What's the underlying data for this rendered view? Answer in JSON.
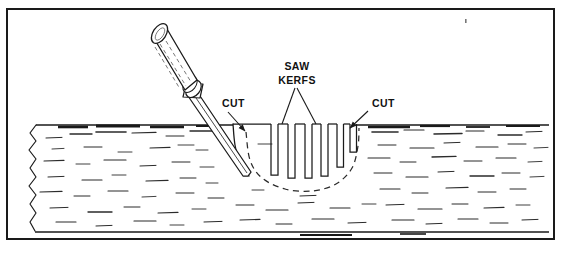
{
  "figure": {
    "domain": "technical-line-illustration",
    "frame": {
      "border_color": "#1a1a1a",
      "border_width_px": 2,
      "x": 6,
      "y": 8,
      "width": 549,
      "height": 232
    },
    "colors": {
      "ink": "#1a1a1a",
      "line": "#222222",
      "grain": "#2b2b2b",
      "paper": "#ffffff",
      "dashed_guide": "#333333"
    }
  },
  "labels": [
    {
      "id": "saw-kerfs",
      "line1": "SAW",
      "line2": "KERFS",
      "x": 297,
      "y": 70
    },
    {
      "id": "cut-left",
      "text": "CUT",
      "x": 222,
      "y": 107
    },
    {
      "id": "cut-right",
      "text": "CUT",
      "x": 372,
      "y": 107
    }
  ],
  "leaders": [
    {
      "id": "saw-kerfs-leader-a",
      "from": [
        295,
        88
      ],
      "to": [
        282,
        124
      ],
      "arrow": false
    },
    {
      "id": "saw-kerfs-leader-b",
      "from": [
        297,
        88
      ],
      "to": [
        316,
        124
      ],
      "arrow": false
    },
    {
      "id": "cut-left-arrow",
      "from": [
        228,
        112
      ],
      "to": [
        245,
        131
      ],
      "arrow": true
    },
    {
      "id": "cut-right-arrow",
      "from": [
        368,
        111
      ],
      "to": [
        350,
        128
      ],
      "arrow": true
    }
  ],
  "workpiece": {
    "name": "wood-stock",
    "top_surface_y": 124,
    "bottom_surface_y": 232,
    "left_break_x": 32,
    "right_edge_x": 549,
    "description": "Side view of a board with torn break line at left edge and wood grain hatching"
  },
  "chisel": {
    "name": "wood-chisel",
    "handle": {
      "butt_center": [
        159,
        41
      ],
      "ferrule_center": [
        208,
        96
      ]
    },
    "blade_tip": [
      248,
      175
    ],
    "description": "Chisel with turned wooden handle, ferrule and long tapered blade driven into the stock"
  },
  "saw_kerfs": {
    "count": 6,
    "description": "Vertical saw kerfs cut from the top surface down to the curved waste line, getting shallower toward the right",
    "kerfs": [
      {
        "index": 1,
        "x_left": 271,
        "width": 7,
        "depth_to_y": 175
      },
      {
        "index": 2,
        "x_left": 288,
        "width": 7,
        "depth_to_y": 178
      },
      {
        "index": 3,
        "x_left": 305,
        "width": 7,
        "depth_to_y": 178
      },
      {
        "index": 4,
        "x_left": 321,
        "width": 7,
        "depth_to_y": 176
      },
      {
        "index": 5,
        "x_left": 337,
        "width": 6.5,
        "depth_to_y": 167
      },
      {
        "index": 6,
        "x_left": 350,
        "width": 6.5,
        "depth_to_y": 152
      }
    ]
  },
  "waste_curve": {
    "name": "dashed-waste-line",
    "style": "dashed",
    "description": "Dashed arc showing the hollow to be removed, running from the chisel cut at left, under the kerfs, and back up to the right CUT mark",
    "points": [
      [
        246,
        132
      ],
      [
        250,
        160
      ],
      [
        262,
        178
      ],
      [
        285,
        189
      ],
      [
        312,
        191
      ],
      [
        336,
        184
      ],
      [
        352,
        168
      ],
      [
        358,
        146
      ],
      [
        359,
        128
      ]
    ]
  },
  "chisel_cut_line": {
    "name": "chisel-entry-cut",
    "description": "Solid curved line at the left side of the hollow where the chisel enters the stock",
    "points": [
      [
        233,
        124
      ],
      [
        235,
        145
      ],
      [
        240,
        163
      ],
      [
        249,
        176
      ]
    ]
  },
  "grain_marks": {
    "description": "Short horizontal dashes representing wood grain on the sawn face",
    "segments": [
      [
        46,
        138,
        16,
        1.0
      ],
      [
        70,
        134,
        22,
        1.4
      ],
      [
        96,
        132,
        30,
        1.6
      ],
      [
        132,
        133,
        24,
        1.2
      ],
      [
        166,
        136,
        18,
        1.0
      ],
      [
        190,
        131,
        26,
        1.4
      ],
      [
        52,
        149,
        12,
        0.9
      ],
      [
        84,
        147,
        18,
        1.0
      ],
      [
        118,
        152,
        14,
        0.9
      ],
      [
        150,
        148,
        20,
        1.1
      ],
      [
        178,
        145,
        16,
        0.9
      ],
      [
        196,
        150,
        12,
        0.9
      ],
      [
        44,
        161,
        20,
        1.1
      ],
      [
        76,
        164,
        14,
        0.9
      ],
      [
        104,
        160,
        22,
        1.2
      ],
      [
        140,
        166,
        16,
        1.0
      ],
      [
        172,
        162,
        18,
        1.0
      ],
      [
        200,
        167,
        14,
        0.9
      ],
      [
        48,
        177,
        16,
        1.0
      ],
      [
        82,
        180,
        20,
        1.1
      ],
      [
        112,
        175,
        14,
        0.9
      ],
      [
        146,
        181,
        22,
        1.2
      ],
      [
        180,
        178,
        16,
        1.0
      ],
      [
        206,
        183,
        12,
        0.9
      ],
      [
        40,
        192,
        22,
        1.2
      ],
      [
        74,
        196,
        16,
        1.0
      ],
      [
        108,
        191,
        20,
        1.1
      ],
      [
        142,
        197,
        14,
        0.9
      ],
      [
        176,
        193,
        18,
        1.0
      ],
      [
        208,
        198,
        16,
        1.0
      ],
      [
        50,
        208,
        18,
        1.0
      ],
      [
        88,
        212,
        24,
        1.3
      ],
      [
        124,
        207,
        16,
        1.0
      ],
      [
        158,
        213,
        20,
        1.1
      ],
      [
        192,
        209,
        14,
        0.9
      ],
      [
        56,
        222,
        20,
        1.1
      ],
      [
        96,
        226,
        16,
        1.0
      ],
      [
        134,
        221,
        22,
        1.2
      ],
      [
        170,
        225,
        14,
        0.9
      ],
      [
        204,
        222,
        18,
        1.0
      ],
      [
        236,
        205,
        18,
        1.0
      ],
      [
        266,
        210,
        22,
        1.2
      ],
      [
        298,
        203,
        16,
        1.0
      ],
      [
        330,
        208,
        20,
        1.1
      ],
      [
        362,
        204,
        14,
        0.9
      ],
      [
        240,
        220,
        20,
        1.1
      ],
      [
        276,
        224,
        16,
        1.0
      ],
      [
        312,
        219,
        22,
        1.2
      ],
      [
        348,
        223,
        18,
        1.0
      ],
      [
        372,
        132,
        26,
        1.6
      ],
      [
        404,
        130,
        20,
        1.2
      ],
      [
        434,
        134,
        28,
        1.5
      ],
      [
        466,
        131,
        18,
        1.1
      ],
      [
        498,
        135,
        24,
        1.3
      ],
      [
        526,
        132,
        16,
        1.0
      ],
      [
        378,
        145,
        18,
        1.0
      ],
      [
        410,
        148,
        24,
        1.2
      ],
      [
        444,
        143,
        16,
        1.0
      ],
      [
        476,
        147,
        22,
        1.2
      ],
      [
        508,
        144,
        18,
        1.0
      ],
      [
        534,
        148,
        14,
        0.9
      ],
      [
        368,
        158,
        22,
        1.1
      ],
      [
        400,
        162,
        16,
        1.0
      ],
      [
        432,
        157,
        24,
        1.3
      ],
      [
        464,
        161,
        18,
        1.0
      ],
      [
        496,
        158,
        20,
        1.1
      ],
      [
        528,
        162,
        14,
        0.9
      ],
      [
        374,
        173,
        18,
        1.0
      ],
      [
        406,
        177,
        22,
        1.2
      ],
      [
        438,
        172,
        16,
        1.0
      ],
      [
        470,
        176,
        24,
        1.3
      ],
      [
        502,
        173,
        18,
        1.0
      ],
      [
        530,
        177,
        14,
        0.9
      ],
      [
        380,
        189,
        20,
        1.1
      ],
      [
        412,
        193,
        16,
        1.0
      ],
      [
        446,
        188,
        22,
        1.2
      ],
      [
        478,
        192,
        18,
        1.0
      ],
      [
        510,
        189,
        16,
        1.0
      ],
      [
        386,
        205,
        18,
        1.0
      ],
      [
        418,
        209,
        24,
        1.2
      ],
      [
        452,
        204,
        16,
        1.0
      ],
      [
        484,
        208,
        20,
        1.1
      ],
      [
        516,
        205,
        14,
        0.9
      ],
      [
        392,
        220,
        22,
        1.2
      ],
      [
        426,
        224,
        16,
        1.0
      ],
      [
        458,
        219,
        20,
        1.1
      ],
      [
        490,
        223,
        18,
        1.0
      ],
      [
        522,
        220,
        16,
        1.0
      ],
      [
        258,
        144,
        14,
        0.9
      ],
      [
        252,
        190,
        12,
        0.9
      ],
      [
        300,
        196,
        16,
        1.0
      ]
    ]
  },
  "surface_shadow_marks": {
    "description": "Heavier dark dashes along the top sawn edge suggesting the cut surface",
    "segments": [
      [
        58,
        127,
        30,
        2.6
      ],
      [
        96,
        126,
        44,
        3.0
      ],
      [
        150,
        127,
        34,
        2.4
      ],
      [
        196,
        126,
        20,
        2.0
      ],
      [
        368,
        127,
        42,
        2.6
      ],
      [
        420,
        126,
        30,
        2.2
      ],
      [
        466,
        127,
        24,
        1.8
      ],
      [
        506,
        126,
        34,
        2.2
      ],
      [
        300,
        235,
        52,
        2.0
      ],
      [
        400,
        234,
        26,
        1.6
      ]
    ]
  }
}
